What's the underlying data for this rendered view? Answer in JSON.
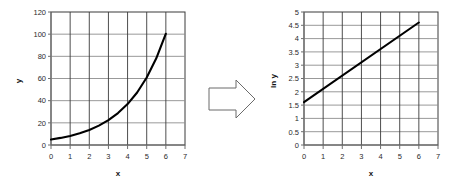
{
  "figure": {
    "title": "",
    "arrow": {
      "name": "transformation-arrow",
      "direction": "right"
    }
  },
  "chart_data": [
    {
      "id": "exponential-plot",
      "type": "line",
      "title": "",
      "xlabel": "x",
      "ylabel": "y",
      "xlim": [
        0,
        7
      ],
      "ylim": [
        0,
        120
      ],
      "xticks": [
        "0",
        "1",
        "2",
        "3",
        "4",
        "5",
        "6",
        "7"
      ],
      "xtick_values": [
        0,
        1,
        2,
        3,
        4,
        5,
        6,
        7
      ],
      "yticks": [
        "0",
        "20",
        "40",
        "60",
        "80",
        "100",
        "120"
      ],
      "ytick_values": [
        0,
        20,
        40,
        60,
        80,
        100,
        120
      ],
      "grid": true,
      "legend": "none",
      "series": [
        {
          "name": "y = 5e^(0.5x)",
          "x": [
            0,
            0.5,
            1,
            1.5,
            2,
            2.5,
            3,
            3.5,
            4,
            4.5,
            5,
            5.5,
            6
          ],
          "values": [
            5,
            6.4,
            8.2,
            10.6,
            13.6,
            17.5,
            22.4,
            28.8,
            36.9,
            47.4,
            60.9,
            78.2,
            100.4
          ]
        }
      ]
    },
    {
      "id": "log-linear-plot",
      "type": "line",
      "title": "",
      "xlabel": "x",
      "ylabel": "ln y",
      "xlim": [
        0,
        7
      ],
      "ylim": [
        0,
        5
      ],
      "xticks": [
        "0",
        "1",
        "2",
        "3",
        "4",
        "5",
        "6",
        "7"
      ],
      "xtick_values": [
        0,
        1,
        2,
        3,
        4,
        5,
        6,
        7
      ],
      "yticks": [
        "0",
        "0.5",
        "1",
        "1.5",
        "2",
        "2.5",
        "3",
        "3.5",
        "4",
        "4.5",
        "5"
      ],
      "ytick_values": [
        0,
        0.5,
        1,
        1.5,
        2,
        2.5,
        3,
        3.5,
        4,
        4.5,
        5
      ],
      "grid": true,
      "legend": "none",
      "series": [
        {
          "name": "ln y = 1.609 + 0.5x",
          "x": [
            0,
            6
          ],
          "values": [
            1.609,
            4.605
          ]
        }
      ]
    }
  ]
}
